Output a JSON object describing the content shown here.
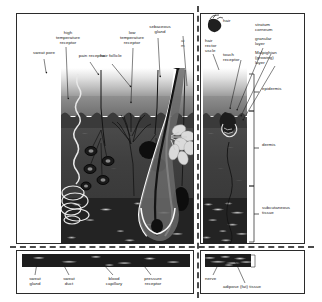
{
  "diagram": {
    "type": "anatomical-cross-section"
  },
  "main_left": {
    "labels": {
      "sweat_pore": "sweat pore",
      "high_temperature_receptor": "high\ntemperature\nreceptor",
      "pain_receptor": "pain receptor",
      "low_temperature_receptor": "low\ntemperature\nreceptor",
      "hair_follicle": "hair follicle",
      "sebaceous_gland": "sebaceous\ngland",
      "edge_partial": "ai\nm"
    }
  },
  "main_right": {
    "labels": {
      "hair": "hair",
      "hair_erector_muscle": "hair\nrector\nuscle",
      "touch_receptor": "touch\nreceptor",
      "stratum_corneum": "stratum\ncorneum",
      "granular_layer": "granular\nlayer",
      "malpighian_layer": "Malpighian\n(growing)\nlayer"
    }
  },
  "strata_brackets": {
    "epidermis": "epidermis",
    "dermis": "dermis",
    "subcutaneous_tissue": "subcutaneous\ntissue"
  },
  "bottom_left": {
    "labels": {
      "sweat_gland": "sweat\ngland",
      "sweat_duct": "sweat\nduct",
      "blood_capillary": "blood\ncapillary",
      "pressure_receptor": "pressure\nreceptor"
    }
  },
  "bottom_right": {
    "labels": {
      "nerve": "nerve",
      "adipose_tissue": "adipose (fat) tissue"
    }
  },
  "colors": {
    "frame_stroke": "#2b2b2b",
    "divider": "#4a4a4a",
    "label_text": "#1a1a1a",
    "surface": "#e2e2e2",
    "epidermis": "#7f7f7f",
    "dermis": "#434343",
    "subcutaneous": "#232323",
    "hair_shaft": "#141414",
    "follicle_highlight": "#f2f2f2",
    "sebaceous_gland": "#d9d9d9",
    "background": "#ffffff"
  }
}
